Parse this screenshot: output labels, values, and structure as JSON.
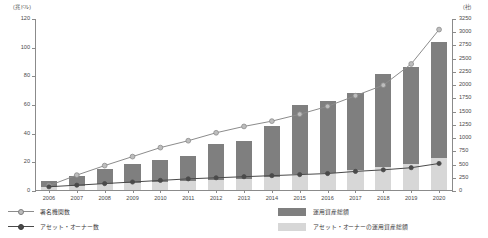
{
  "axes": {
    "left_unit": "(兆ドル)",
    "right_unit": "(社)",
    "left_ticks": [
      "0",
      "20",
      "40",
      "60",
      "80",
      "100",
      "120"
    ],
    "right_ticks": [
      "0",
      "250",
      "500",
      "750",
      "1000",
      "1250",
      "1500",
      "1750",
      "2000",
      "2250",
      "2500",
      "2750",
      "3000",
      "3250"
    ]
  },
  "legend": {
    "signatories": "署名機関数",
    "asset_owners": "アセット・オーナー数",
    "aum_total": "運用資産総額",
    "aum_owner": "アセット・オーナーの運用資産総額"
  },
  "colors": {
    "bar_total": "#7f7f7f",
    "bar_owner": "#d7d7d7",
    "line_signatories": "#8c8c8c",
    "line_owners": "#4a4a4a",
    "axis": "#8b8b8b"
  },
  "chart_data": {
    "type": "bar",
    "title": "",
    "xlabel": "",
    "ylabel": "兆ドル",
    "y2label": "社",
    "grid": false,
    "legend_position": "bottom",
    "categories": [
      "2006",
      "2007",
      "2008",
      "2009",
      "2010",
      "2011",
      "2012",
      "2013",
      "2014",
      "2015",
      "2016",
      "2017",
      "2018",
      "2019",
      "2020"
    ],
    "ylim": [
      0,
      120
    ],
    "y2lim": [
      0,
      3250
    ],
    "series": [
      {
        "name": "運用資産総額",
        "type": "bar",
        "axis": "left",
        "unit": "兆ドル",
        "values": [
          6.5,
          10,
          15,
          18,
          21,
          24,
          32,
          34,
          45,
          59,
          62,
          68,
          81,
          86,
          103
        ]
      },
      {
        "name": "アセット・オーナーの運用資産総額",
        "type": "bar",
        "axis": "left",
        "unit": "兆ドル",
        "values": [
          2,
          3,
          4,
          5,
          5.5,
          6,
          7,
          7.5,
          9,
          11,
          12,
          14,
          16,
          18,
          22
        ]
      },
      {
        "name": "署名機関数",
        "type": "line",
        "axis": "right",
        "unit": "社",
        "values": [
          100,
          300,
          480,
          650,
          820,
          950,
          1100,
          1220,
          1320,
          1450,
          1600,
          1800,
          2000,
          2400,
          3050
        ]
      },
      {
        "name": "アセット・オーナー数",
        "type": "line",
        "axis": "right",
        "unit": "社",
        "values": [
          80,
          110,
          140,
          170,
          200,
          230,
          250,
          270,
          290,
          310,
          330,
          370,
          400,
          440,
          520
        ]
      }
    ]
  }
}
